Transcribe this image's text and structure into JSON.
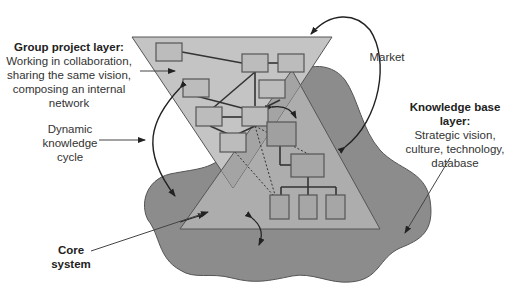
{
  "diagram": {
    "labels": {
      "group_project": {
        "title": "Group project layer:",
        "lines": [
          "Working in collaboration,",
          "sharing the same vision,",
          "composing an internal",
          "network"
        ]
      },
      "market": "Market",
      "knowledge_base": {
        "title": "Knowledge base layer:",
        "lines": [
          "Strategic vision,",
          "culture, technology,",
          "database"
        ]
      },
      "dynamic_cycle": [
        "Dynamic",
        "knowledge",
        "cycle"
      ],
      "core_system": [
        "Core",
        "system"
      ]
    },
    "colors": {
      "blob": "#8c8c8c",
      "inverted_triangle": "#c4c4c4",
      "upright_triangle": "#adadad",
      "overlap": "#9f9f9f",
      "box_fill": "#bcbcbc",
      "stroke": "#333333"
    },
    "layers": [
      "Group project layer",
      "Core system",
      "Knowledge base layer"
    ]
  }
}
